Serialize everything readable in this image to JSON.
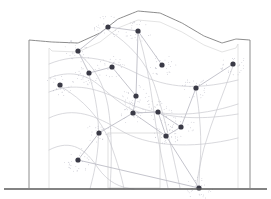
{
  "figure": {
    "type": "diagram",
    "width": 271,
    "height": 199,
    "background_color": "#ffffff"
  },
  "colors": {
    "outline": "#6e6e6e",
    "outline_light": "#b9b9b9",
    "ground_line": "#5a5a5a",
    "flow_curve": "#c9c9cf",
    "node_fill": "#3a3a46",
    "halo_dot": "#b6b6c2",
    "edge": "#bdbdc6",
    "interior_line": "#d7d7d7"
  },
  "building": {
    "name": "facade-elevation",
    "baseline_y": 188,
    "left_wall_x": 29,
    "right_wall_x": 250,
    "left_shoulder_y": 40,
    "right_shoulder_y": 40,
    "roof_peak": {
      "x": 138,
      "y": 11
    },
    "inner_left_x": 49,
    "inner_right_x": 238,
    "roof_profile_points": "29,40 52,42 78,43 100,33 118,19 138,11 160,13 182,23 204,36 222,43 236,39 250,40",
    "doorway": {
      "x": 108,
      "y": 133,
      "width": 52,
      "height": 55
    },
    "ground_line": {
      "x1": 4,
      "y1": 189,
      "x2": 267,
      "y2": 189
    }
  },
  "network": {
    "name": "node-network",
    "node_count": 20,
    "nodes": [
      {
        "id": "n1",
        "x": 108,
        "y": 27,
        "r": 2.6
      },
      {
        "id": "n2",
        "x": 138,
        "y": 31,
        "r": 2.6
      },
      {
        "id": "n3",
        "x": 78,
        "y": 51,
        "r": 2.6
      },
      {
        "id": "n4",
        "x": 162,
        "y": 65,
        "r": 2.6
      },
      {
        "id": "n5",
        "x": 233,
        "y": 64,
        "r": 2.6
      },
      {
        "id": "n6",
        "x": 112,
        "y": 67,
        "r": 2.6
      },
      {
        "id": "n7",
        "x": 89,
        "y": 73,
        "r": 2.6
      },
      {
        "id": "n8",
        "x": 60,
        "y": 85,
        "r": 2.6
      },
      {
        "id": "n9",
        "x": 196,
        "y": 88,
        "r": 2.6
      },
      {
        "id": "n10",
        "x": 136,
        "y": 96,
        "r": 2.6
      },
      {
        "id": "n11",
        "x": 133,
        "y": 113,
        "r": 2.6
      },
      {
        "id": "n12",
        "x": 158,
        "y": 112,
        "r": 2.6
      },
      {
        "id": "n13",
        "x": 181,
        "y": 127,
        "r": 2.6
      },
      {
        "id": "n14",
        "x": 166,
        "y": 136,
        "r": 2.6
      },
      {
        "id": "n15",
        "x": 99,
        "y": 133,
        "r": 2.6
      },
      {
        "id": "n16",
        "x": 78,
        "y": 160,
        "r": 2.6
      },
      {
        "id": "n17",
        "x": 199,
        "y": 188,
        "r": 2.6
      }
    ],
    "edges": [
      {
        "from": "n3",
        "to": "n1"
      },
      {
        "from": "n1",
        "to": "n2"
      },
      {
        "from": "n2",
        "to": "n4"
      },
      {
        "from": "n3",
        "to": "n7"
      },
      {
        "from": "n7",
        "to": "n6"
      },
      {
        "from": "n6",
        "to": "n10"
      },
      {
        "from": "n10",
        "to": "n11"
      },
      {
        "from": "n11",
        "to": "n12"
      },
      {
        "from": "n12",
        "to": "n13"
      },
      {
        "from": "n13",
        "to": "n9"
      },
      {
        "from": "n9",
        "to": "n5"
      },
      {
        "from": "n11",
        "to": "n15"
      },
      {
        "from": "n15",
        "to": "n16"
      },
      {
        "from": "n13",
        "to": "n14"
      },
      {
        "from": "n14",
        "to": "n17"
      },
      {
        "from": "n12",
        "to": "n14"
      },
      {
        "from": "n2",
        "to": "n10"
      },
      {
        "from": "n11",
        "to": "n14"
      },
      {
        "from": "n16",
        "to": "n17"
      }
    ]
  },
  "flow_curves": {
    "name": "flow-curve-set",
    "stroke_width": 0.7,
    "paths": [
      "M49,64 C78,52 106,58 134,72 C162,86 190,92 238,80",
      "M49,92 C80,80 104,92 130,104 C158,117 196,118 238,104",
      "M49,118 C74,106 96,116 120,130 C146,146 190,150 238,138",
      "M49,150 C72,138 86,150 98,168 C108,182 120,188 134,189",
      "M108,30 C130,44 146,62 154,84 C162,108 170,140 180,188",
      "M138,33 C146,58 150,84 154,112 C158,142 164,168 168,188",
      "M60,86 C84,100 100,118 110,142 C118,164 122,178 124,189",
      "M196,90 C200,114 202,140 200,164 C199,178 199,185 199,189",
      "M233,66 C224,92 212,120 204,148 C199,168 197,182 196,189",
      "M49,78 C70,70 86,74 100,86 C116,100 128,110 142,113",
      "M158,113 C178,118 202,120 238,114",
      "M78,53 C94,66 104,84 108,106 C112,130 112,160 110,189",
      "M89,75 C96,96 100,120 98,146 C96,168 92,180 90,189"
    ]
  },
  "halo": {
    "name": "scatter-halo",
    "dots_per_node": 26,
    "spread_radius": 11,
    "dot_radius": 0.45
  }
}
